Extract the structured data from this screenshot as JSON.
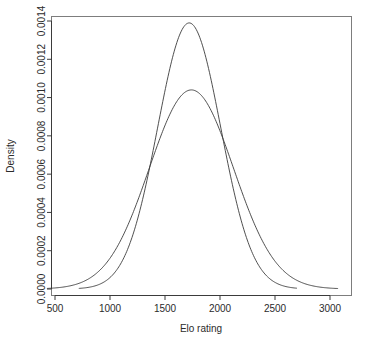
{
  "chart_data": {
    "type": "line",
    "title": "",
    "xlabel": "Elo rating",
    "ylabel": "Density",
    "xlim": [
      420,
      3080
    ],
    "ylim": [
      0,
      0.0014
    ],
    "grid": false,
    "legend": "none",
    "xticks": [
      500,
      1000,
      1500,
      2000,
      2500,
      3000
    ],
    "xtick_labels": [
      "500",
      "1000",
      "1500",
      "2000",
      "2500",
      "3000"
    ],
    "yticks": [
      0.0,
      0.0002,
      0.0004,
      0.0006,
      0.0008,
      0.001,
      0.0012,
      0.0014
    ],
    "ytick_labels": [
      "0.0000",
      "0.0002",
      "0.0004",
      "0.0006",
      "0.0008",
      "0.0010",
      "0.0012",
      "0.0014"
    ],
    "line_color": "#3b3b3b",
    "series": [
      {
        "name": "narrow-density-curve",
        "peak_x": 1720,
        "peak_y": 0.00139,
        "sigma": 287,
        "x_start": 720,
        "x_end": 2700,
        "x": [
          720,
          800,
          900,
          1000,
          1100,
          1200,
          1300,
          1400,
          1500,
          1600,
          1650,
          1700,
          1720,
          1750,
          1800,
          1900,
          2000,
          2100,
          2200,
          2300,
          2400,
          2500,
          2600,
          2700
        ],
        "y": [
          1e-05,
          3e-05,
          8e-05,
          0.00017,
          0.00033,
          0.00057,
          0.00085,
          0.00112,
          0.00131,
          0.00138,
          0.00139,
          0.00139,
          0.00139,
          0.00137,
          0.00133,
          0.00118,
          0.00093,
          0.00066,
          0.00042,
          0.00023,
          0.00011,
          5e-05,
          2e-05,
          1e-05
        ]
      },
      {
        "name": "wide-density-curve",
        "peak_x": 1740,
        "peak_y": 0.00104,
        "sigma": 383,
        "x_start": 430,
        "x_end": 3070,
        "x": [
          430,
          500,
          600,
          700,
          800,
          900,
          1000,
          1100,
          1200,
          1300,
          1400,
          1500,
          1600,
          1700,
          1740,
          1800,
          1900,
          2000,
          2100,
          2200,
          2300,
          2400,
          2500,
          2600,
          2700,
          2800,
          2900,
          3000,
          3070
        ],
        "y": [
          3e-05,
          4e-05,
          7e-05,
          0.00011,
          0.00017,
          0.00026,
          0.00038,
          0.00052,
          0.00067,
          0.00081,
          0.00093,
          0.00101,
          0.00104,
          0.00104,
          0.00104,
          0.00102,
          0.00096,
          0.00087,
          0.00075,
          0.00061,
          0.00047,
          0.00034,
          0.00024,
          0.00016,
          0.0001,
          6e-05,
          4e-05,
          2e-05,
          2e-05
        ]
      }
    ],
    "crossovers": [
      {
        "x": 1370,
        "y": 0.00066
      },
      {
        "x": 2060,
        "y": 0.00079
      }
    ]
  }
}
